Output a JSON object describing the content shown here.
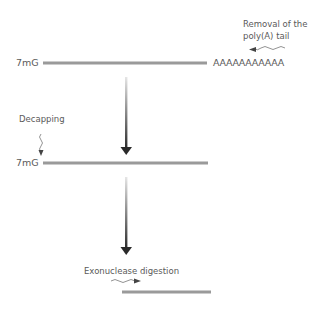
{
  "diagram": {
    "stage1": {
      "cap_label": "7mG",
      "tail_label": "AAAAAAAAAAA",
      "annotation_line1": "Removal of the",
      "annotation_line2": "poly(A) tail"
    },
    "stage2": {
      "cap_label": "7mG",
      "annotation": "Decapping"
    },
    "stage3": {
      "annotation": "Exonuclease digestion"
    },
    "colors": {
      "strand": "#9a9a9a",
      "arrow_dark": "#2a2a2a",
      "arrow_light": "#e0e0e0",
      "text": "#5a5a5a"
    }
  }
}
